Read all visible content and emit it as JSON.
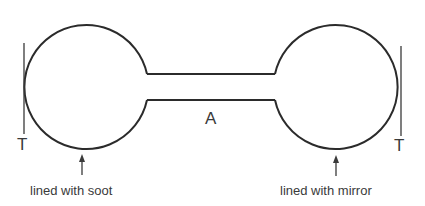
{
  "diagram": {
    "labels": {
      "left_thermometer": "T",
      "right_thermometer": "T",
      "tube": "A",
      "left_bulb": "lined with soot",
      "right_bulb": "lined with mirror"
    },
    "colors": {
      "line": "#2b2b2b",
      "text": "#3a3a3a",
      "background": "#ffffff"
    }
  }
}
